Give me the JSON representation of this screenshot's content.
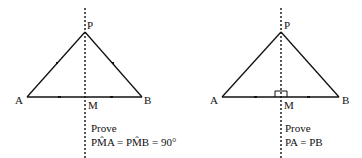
{
  "figures": [
    {
      "id": "left",
      "points": {
        "P": "P",
        "A": "A",
        "B": "B",
        "M": "M"
      },
      "prove_label": "Prove",
      "statement": "PM̂A = PM̂B = 90°",
      "marks": "PA = PB equal tick marks; AM = MB equal tick marks"
    },
    {
      "id": "right",
      "points": {
        "P": "P",
        "A": "A",
        "B": "B",
        "M": "M"
      },
      "prove_label": "Prove",
      "statement": "PA = PB",
      "marks": "AM = MB equal tick marks; right angle at M"
    }
  ],
  "colors": {
    "ink": "#111111",
    "background": "#ffffff"
  }
}
